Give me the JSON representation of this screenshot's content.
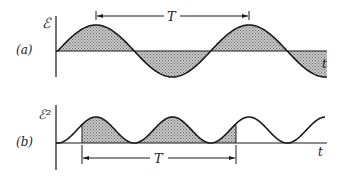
{
  "figure": {
    "panel_a": {
      "label": "(a)",
      "y_axis_label": "ℰ",
      "x_axis_label": "t",
      "period_label": "T",
      "curve": "sine, shaded between curve and axis"
    },
    "panel_b": {
      "label": "(b)",
      "y_axis_label": "ℰ²",
      "x_axis_label": "t",
      "period_label": "T",
      "curve": "sine squared, shaded over one period T"
    }
  },
  "colors": {
    "line": "#1a1a1a",
    "shade": "#9a9a9a",
    "background": "#ffffff"
  }
}
